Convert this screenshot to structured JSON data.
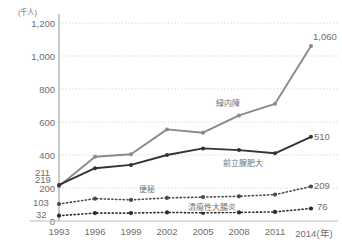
{
  "chart_data": {
    "type": "line",
    "title": "",
    "subtitle": "",
    "xlabel": "年",
    "ylabel": "千人",
    "y_unit_label": "(千人)",
    "categories": [
      "1993",
      "1996",
      "1999",
      "2002",
      "2005",
      "2008",
      "2011",
      "2014"
    ],
    "x_axis_suffix": "(年)",
    "xticklabels": [
      "1993",
      "1996",
      "1999",
      "2002",
      "2005",
      "2008",
      "2011",
      "2014(年)"
    ],
    "ylim": [
      0,
      1200
    ],
    "yticks": [
      0,
      200,
      400,
      600,
      800,
      1000,
      1200
    ],
    "yticklabels": [
      "0",
      "200",
      "400",
      "600",
      "800",
      "1,000",
      "1,200"
    ],
    "grid": true,
    "legend": "inline-annotations",
    "series": [
      {
        "name": "緑内障",
        "color": "#8a8a8a",
        "style": "solid",
        "values": [
          211,
          390,
          405,
          555,
          535,
          640,
          710,
          1060
        ],
        "start_label": "211",
        "end_label": "1,060"
      },
      {
        "name": "前立腺肥大",
        "color": "#333333",
        "style": "solid",
        "values": [
          219,
          320,
          340,
          400,
          440,
          430,
          410,
          510
        ],
        "start_label": "219",
        "end_label": "510"
      },
      {
        "name": "便秘",
        "color": "#4a4a4a",
        "style": "dotted",
        "values": [
          103,
          135,
          128,
          140,
          145,
          150,
          160,
          209
        ],
        "start_label": "103",
        "end_label": "209"
      },
      {
        "name": "潰瘍性大腸炎",
        "color": "#2b2b2b",
        "style": "dotted",
        "values": [
          32,
          48,
          48,
          52,
          50,
          52,
          55,
          76
        ],
        "start_label": "32",
        "end_label": "76"
      }
    ]
  },
  "colors": {
    "grid": "#d9d9d9",
    "axis": "#bdbdbd",
    "text": "#6e6e6e",
    "series_gray": "#8a8a8a",
    "series_black": "#333333"
  }
}
